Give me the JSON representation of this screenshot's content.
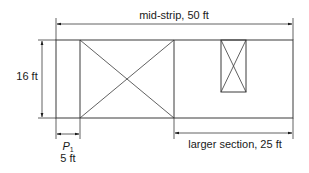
{
  "diagram": {
    "colors": {
      "line": "#3a3a3a",
      "text": "#1a1a1a",
      "background": "#ffffff"
    },
    "labels": {
      "mid_strip": "mid-strip, 50 ft",
      "height": "16 ft",
      "panel_label": "P",
      "panel_sub": "1",
      "panel_width": "5 ft",
      "larger_section": "larger section, 25 ft"
    },
    "shapes": {
      "outer_rect": {
        "x": 56,
        "y": 40,
        "w": 237,
        "h": 78
      },
      "p1_divider_x": 80,
      "center_divider_x": 174,
      "large_x_panel": {
        "x": 80,
        "y": 40,
        "w": 94,
        "h": 78
      },
      "small_x_panel": {
        "x": 221,
        "y": 40,
        "w": 25,
        "h": 52
      }
    }
  }
}
